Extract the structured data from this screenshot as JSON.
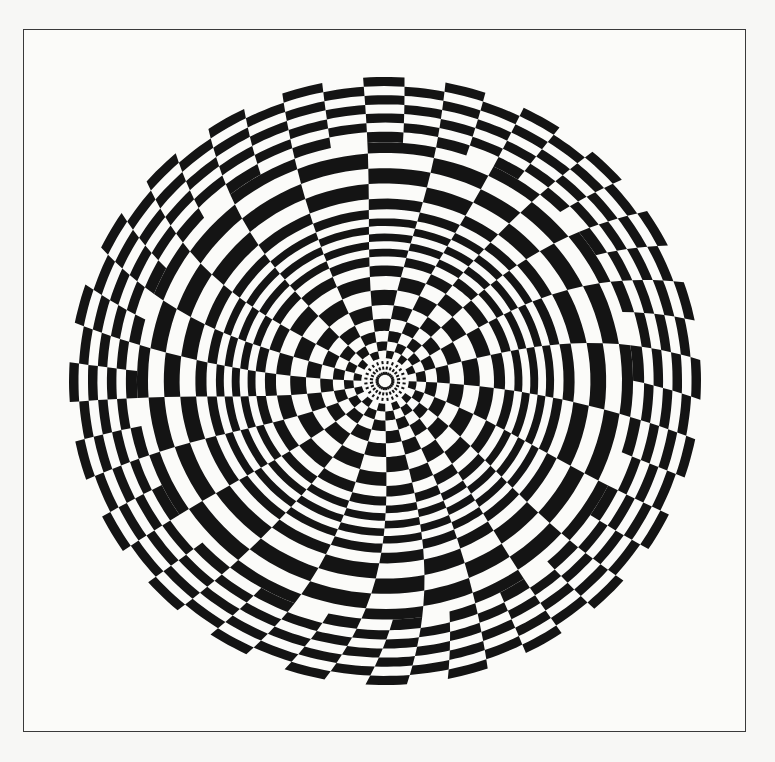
{
  "artwork": {
    "title": "Radial checkerboard op-art",
    "colors": {
      "ink": "#141414",
      "paper": "#fbfbf9",
      "background": "#f7f7f5",
      "frame": "#3a3a3a"
    },
    "frame": {
      "left": 23,
      "top": 29,
      "right": 746,
      "bottom": 732
    },
    "disc": {
      "cx": 385,
      "cy": 381,
      "rx": 316,
      "ry": 304
    },
    "sectors": 24,
    "core_radius": 0.075,
    "rings": [
      0.075,
      0.1,
      0.13,
      0.165,
      0.205,
      0.25,
      0.3,
      0.345,
      0.38,
      0.41,
      0.435,
      0.46,
      0.485,
      0.51,
      0.535,
      0.565,
      0.6,
      0.65,
      0.7,
      0.75,
      0.785,
      0.82,
      0.85,
      0.88,
      0.91,
      0.94,
      0.97,
      1.0
    ],
    "twist": 0.55,
    "lens_amplitude": 0.5
  }
}
